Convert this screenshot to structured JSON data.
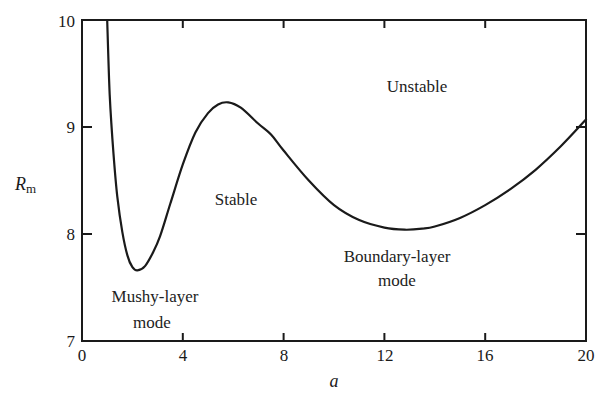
{
  "chart_data": {
    "type": "line",
    "title": "",
    "xlabel": "a",
    "ylabel": "R_m",
    "ylabel_main": "R",
    "ylabel_sub": "m",
    "xlim": [
      0,
      20
    ],
    "ylim": [
      7,
      10
    ],
    "x_ticks": [
      0,
      4,
      8,
      12,
      16,
      20
    ],
    "y_ticks": [
      7,
      8,
      9,
      10
    ],
    "grid": false,
    "legend": null,
    "series": [
      {
        "name": "Neutral stability curve",
        "x": [
          1.0,
          1.1,
          1.25,
          1.4,
          1.6,
          1.8,
          2.0,
          2.2,
          2.5,
          2.8,
          3.1,
          3.5,
          4.0,
          4.5,
          5.0,
          5.4,
          5.8,
          6.3,
          7.0,
          7.5,
          8.0,
          9.0,
          10.0,
          11.0,
          12.0,
          12.8,
          13.5,
          14.0,
          15.0,
          16.0,
          17.0,
          18.0,
          19.0,
          20.0
        ],
        "values": [
          10.0,
          9.3,
          8.75,
          8.35,
          8.02,
          7.8,
          7.69,
          7.66,
          7.7,
          7.82,
          7.98,
          8.28,
          8.65,
          8.95,
          9.13,
          9.21,
          9.23,
          9.18,
          9.03,
          8.93,
          8.78,
          8.5,
          8.27,
          8.13,
          8.06,
          8.04,
          8.05,
          8.07,
          8.15,
          8.27,
          8.42,
          8.6,
          8.82,
          9.07
        ]
      }
    ],
    "annotations": [
      {
        "text": "Unstable",
        "x": 13.3,
        "y": 9.35
      },
      {
        "text": "Stable",
        "x": 6.1,
        "y": 8.32
      },
      {
        "text": "Boundary-layer",
        "x": 12.5,
        "y": 7.98
      },
      {
        "text": "mode",
        "x": 12.5,
        "y": 7.75
      },
      {
        "text": "Mushy-layer",
        "x": 2.9,
        "y": 7.38
      },
      {
        "text": "mode",
        "x": 2.9,
        "y": 7.15
      }
    ]
  },
  "labels": {
    "unstable": "Unstable",
    "stable": "Stable",
    "boundary_layer_1": "Boundary-layer",
    "boundary_layer_2": "mode",
    "mushy_layer_1": "Mushy-layer",
    "mushy_layer_2": "mode"
  },
  "axes": {
    "x_title": "a",
    "y_title_main": "R",
    "y_title_sub": "m",
    "x_tick_labels": [
      "0",
      "4",
      "8",
      "12",
      "16",
      "20"
    ],
    "y_tick_labels": [
      "7",
      "8",
      "9",
      "10"
    ]
  },
  "colors": {
    "line": "#1a1a1a",
    "frame": "#1a1a1a",
    "background": "#ffffff"
  }
}
